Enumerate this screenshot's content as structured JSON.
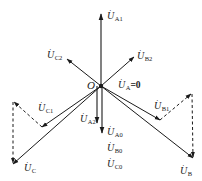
{
  "diagram": {
    "type": "phasor-diagram",
    "origin": {
      "label": "O",
      "x": 101,
      "y": 86
    },
    "line_color": "#1a1a1a",
    "phasors": [
      {
        "id": "UA1",
        "symbol": "U",
        "subscript": "A1",
        "tip": [
          101,
          13
        ],
        "style": "solid"
      },
      {
        "id": "UB2",
        "symbol": "U",
        "subscript": "B2",
        "tip": [
          134,
          57
        ],
        "style": "solid"
      },
      {
        "id": "UC2",
        "symbol": "U",
        "subscript": "C2",
        "tip": [
          67,
          59
        ],
        "style": "solid"
      },
      {
        "id": "UC1",
        "symbol": "U",
        "subscript": "C1",
        "tip": [
          42,
          127
        ],
        "style": "solid"
      },
      {
        "id": "UB1",
        "symbol": "U",
        "subscript": "B1",
        "tip": [
          160,
          120
        ],
        "style": "solid"
      },
      {
        "id": "UA2",
        "symbol": "U",
        "subscript": "A2",
        "tip": [
          97,
          123
        ],
        "style": "solid"
      },
      {
        "id": "UA0",
        "symbol": "U",
        "subscript": "A0",
        "tip": [
          102,
          133
        ],
        "style": "solid"
      },
      {
        "id": "UC",
        "symbol": "U",
        "subscript": "C",
        "tip": [
          13,
          164
        ],
        "style": "solid"
      },
      {
        "id": "UB",
        "symbol": "U",
        "subscript": "B",
        "tip": [
          193,
          158
        ],
        "style": "solid"
      }
    ],
    "dashed_segments": [
      {
        "from": [
          42,
          127
        ],
        "to": [
          13,
          101
        ]
      },
      {
        "from": [
          13,
          101
        ],
        "to": [
          13,
          164
        ]
      },
      {
        "from": [
          160,
          120
        ],
        "to": [
          192,
          93
        ]
      },
      {
        "from": [
          192,
          93
        ],
        "to": [
          193,
          158
        ]
      }
    ],
    "labels": {
      "UA1": {
        "symbol": "U",
        "sub": "A1"
      },
      "UB2": {
        "symbol": "U",
        "sub": "B2"
      },
      "UC2": {
        "symbol": "U",
        "sub": "C2"
      },
      "UA_zero": {
        "symbol": "U",
        "sub": "A",
        "eq": "=0"
      },
      "UC1": {
        "symbol": "U",
        "sub": "C1"
      },
      "UB1": {
        "symbol": "U",
        "sub": "B1"
      },
      "UA2": {
        "symbol": "U",
        "sub": "A2"
      },
      "UA0": {
        "symbol": "U",
        "sub": "A0"
      },
      "UB0": {
        "symbol": "U",
        "sub": "B0"
      },
      "UC0": {
        "symbol": "U",
        "sub": "C0"
      },
      "UC": {
        "symbol": "U",
        "sub": "C"
      },
      "UB": {
        "symbol": "U",
        "sub": "B"
      }
    },
    "dot_glyph": "·"
  }
}
